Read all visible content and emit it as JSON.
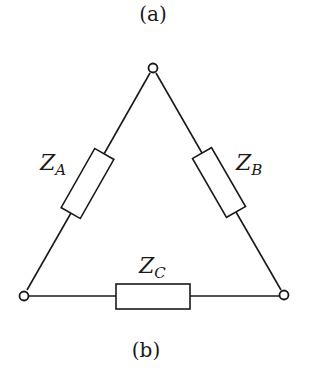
{
  "captions": {
    "top": "(a)",
    "bottom": "(b)"
  },
  "diagram": {
    "type": "delta-connected impedance network",
    "nodes": [
      {
        "id": "top",
        "x": 153,
        "y": 68
      },
      {
        "id": "left",
        "x": 24,
        "y": 295
      },
      {
        "id": "right",
        "x": 284,
        "y": 295
      }
    ],
    "impedances": [
      {
        "id": "ZA",
        "symbol": "Z",
        "subscript": "A",
        "between": [
          "top",
          "left"
        ]
      },
      {
        "id": "ZB",
        "symbol": "Z",
        "subscript": "B",
        "between": [
          "top",
          "right"
        ]
      },
      {
        "id": "ZC",
        "symbol": "Z",
        "subscript": "C",
        "between": [
          "left",
          "right"
        ]
      }
    ],
    "stroke_color": "#1a1a1a"
  }
}
